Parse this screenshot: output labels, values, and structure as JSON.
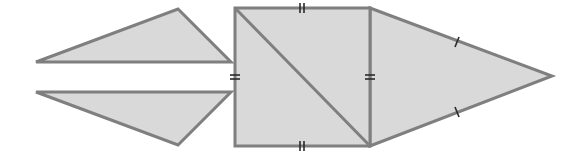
{
  "diagram": {
    "colors": {
      "fill": "#d9d9d9",
      "stroke": "#7f7f7f",
      "tick": "#2a2a2a",
      "background": "#ffffff"
    },
    "shapes": [
      {
        "id": "upper-left-triangle",
        "type": "triangle",
        "points": [
          [
            36,
            62
          ],
          [
            178,
            9
          ],
          [
            231,
            62
          ]
        ]
      },
      {
        "id": "lower-left-triangle",
        "type": "triangle",
        "points": [
          [
            36,
            92
          ],
          [
            231,
            92
          ],
          [
            178,
            145
          ]
        ]
      },
      {
        "id": "square",
        "type": "square",
        "points": [
          [
            235,
            8
          ],
          [
            370,
            8
          ],
          [
            370,
            146
          ],
          [
            235,
            146
          ]
        ]
      },
      {
        "id": "square-diagonal",
        "type": "line",
        "points": [
          [
            235,
            8
          ],
          [
            370,
            146
          ]
        ]
      },
      {
        "id": "right-triangle",
        "type": "triangle",
        "points": [
          [
            370,
            8
          ],
          [
            552,
            76
          ],
          [
            370,
            146
          ]
        ]
      }
    ],
    "tick_marks": [
      {
        "edge": "square-top",
        "count": 2,
        "at": [
          302,
          8
        ],
        "orientation": "vertical"
      },
      {
        "edge": "square-bottom",
        "count": 2,
        "at": [
          302,
          146
        ],
        "orientation": "vertical"
      },
      {
        "edge": "square-left",
        "count": 2,
        "at": [
          235,
          77
        ],
        "orientation": "horizontal"
      },
      {
        "edge": "square-right",
        "count": 2,
        "at": [
          370,
          77
        ],
        "orientation": "horizontal"
      },
      {
        "edge": "right-triangle-upper",
        "count": 1,
        "at": [
          457,
          42
        ]
      },
      {
        "edge": "right-triangle-lower",
        "count": 1,
        "at": [
          457,
          112
        ]
      }
    ]
  }
}
